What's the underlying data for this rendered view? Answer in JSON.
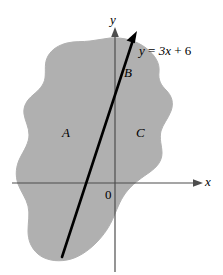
{
  "figure": {
    "kind": "math-diagram",
    "colors": {
      "region_fill": "#b0b0b0",
      "region_stroke": "#b0b0b0",
      "axis": "#4d4d4d",
      "line": "#000000",
      "background": "#ffffff",
      "text": "#000000"
    },
    "axes": {
      "x_label": "x",
      "y_label": "y",
      "origin_label": "0"
    },
    "line": {
      "equation_label": "y = 3x + 6",
      "equation_lhs": "y",
      "equation_rhs_coeff": "3x",
      "equation_plus": "+",
      "equation_const": "6",
      "slope": 3,
      "intercept": 6,
      "arrow": "up-right"
    },
    "regions": [
      {
        "id": "A",
        "label": "A"
      },
      {
        "id": "B",
        "label": "B"
      },
      {
        "id": "C",
        "label": "C"
      }
    ]
  }
}
